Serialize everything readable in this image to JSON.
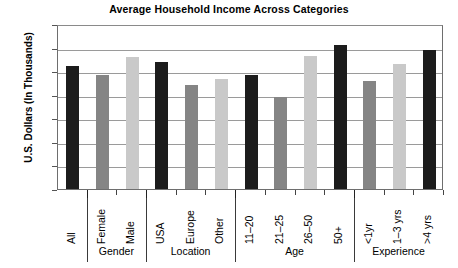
{
  "chart_data": {
    "type": "bar",
    "title": "Average Household Income Across Categories",
    "xlabel": "",
    "ylabel": "U.S. Dollars (In Thousands)",
    "ylim": [
      0,
      70
    ],
    "ytick_step": 10,
    "yticks": [
      "70",
      "60",
      "50",
      "40",
      "30",
      "20",
      "10",
      "0"
    ],
    "grid": true,
    "legend": "none",
    "categories": [
      "All",
      "Female",
      "Male",
      "USA",
      "Europe",
      "Other",
      "11–20",
      "21–25",
      "26–50",
      "50+",
      "<1yr",
      "1–3 yrs",
      ">4 yrs"
    ],
    "values": [
      52,
      48.5,
      56,
      54,
      44,
      46.5,
      48.5,
      39,
      56.5,
      61,
      46,
      53,
      59
    ],
    "bar_colors": [
      "#1c1c1c",
      "#858585",
      "#c9c9c9",
      "#1c1c1c",
      "#858585",
      "#c9c9c9",
      "#1c1c1c",
      "#858585",
      "#c9c9c9",
      "#1c1c1c",
      "#858585",
      "#c9c9c9",
      "#1c1c1c"
    ],
    "groups": [
      {
        "label": "",
        "start": 0,
        "end": 0
      },
      {
        "label": "Gender",
        "start": 1,
        "end": 2
      },
      {
        "label": "Location",
        "start": 3,
        "end": 5
      },
      {
        "label": "Age",
        "start": 6,
        "end": 9
      },
      {
        "label": "Experience",
        "start": 10,
        "end": 12
      }
    ],
    "colors": {
      "dark": "#1c1c1c",
      "medium": "#858585",
      "light": "#c9c9c9",
      "grid": "#9a9a9a",
      "frame": "#6e6e6e",
      "background": "#ffffff",
      "text": "#000000"
    }
  }
}
